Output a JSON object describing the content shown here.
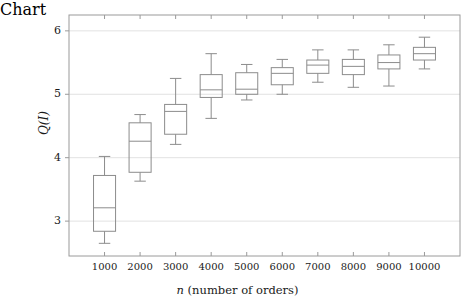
{
  "chart_data": {
    "type": "box",
    "title": "",
    "xlabel": "n (number of orders)",
    "xlabel_italic_prefix": "n",
    "xlabel_rest": " (number of orders)",
    "ylabel": "Q(I)",
    "categories": [
      "1000",
      "2000",
      "3000",
      "4000",
      "5000",
      "6000",
      "7000",
      "8000",
      "9000",
      "10000"
    ],
    "ylim": [
      2.45,
      6.25
    ],
    "xlim": [
      0,
      11
    ],
    "yticks": [
      3,
      4,
      5,
      6
    ],
    "ytick_labels": [
      "3",
      "4",
      "5",
      "6"
    ],
    "grid": "horizontal",
    "legend": "none",
    "boxes": [
      {
        "category": "1000",
        "whisker_low": 2.65,
        "q1": 2.84,
        "median": 3.21,
        "q3": 3.72,
        "whisker_high": 4.02
      },
      {
        "category": "2000",
        "whisker_low": 3.63,
        "q1": 3.77,
        "median": 4.26,
        "q3": 4.55,
        "whisker_high": 4.68
      },
      {
        "category": "3000",
        "whisker_low": 4.21,
        "q1": 4.37,
        "median": 4.73,
        "q3": 4.84,
        "whisker_high": 5.25
      },
      {
        "category": "4000",
        "whisker_low": 4.62,
        "q1": 4.95,
        "median": 5.07,
        "q3": 5.31,
        "whisker_high": 5.64
      },
      {
        "category": "5000",
        "whisker_low": 4.91,
        "q1": 5.0,
        "median": 5.08,
        "q3": 5.34,
        "whisker_high": 5.47
      },
      {
        "category": "6000",
        "whisker_low": 5.0,
        "q1": 5.15,
        "median": 5.33,
        "q3": 5.42,
        "whisker_high": 5.55
      },
      {
        "category": "7000",
        "whisker_low": 5.19,
        "q1": 5.33,
        "median": 5.46,
        "q3": 5.54,
        "whisker_high": 5.7
      },
      {
        "category": "8000",
        "whisker_low": 5.11,
        "q1": 5.31,
        "median": 5.44,
        "q3": 5.55,
        "whisker_high": 5.7
      },
      {
        "category": "9000",
        "whisker_low": 5.13,
        "q1": 5.4,
        "median": 5.5,
        "q3": 5.62,
        "whisker_high": 5.78
      },
      {
        "category": "10000",
        "whisker_low": 5.4,
        "q1": 5.54,
        "median": 5.64,
        "q3": 5.74,
        "whisker_high": 5.9
      }
    ],
    "colors": {
      "box_stroke": "#8c8c8c",
      "median_stroke": "#8c8c8c",
      "whisker_stroke": "#8c8c8c",
      "grid": "#e2e2e2",
      "frame": "#9a9a9a",
      "text": "#1a1a1a",
      "background": "#ffffff"
    }
  }
}
